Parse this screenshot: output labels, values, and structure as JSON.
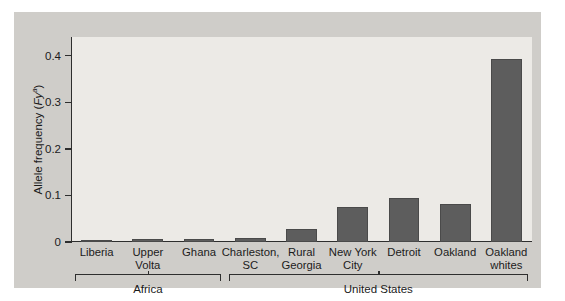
{
  "chart_data": {
    "type": "bar",
    "title": "",
    "xlabel": "",
    "ylabel": "Allele frequency (Fy^a)",
    "ylabel_parts": {
      "prefix": "Allele frequency (",
      "italic": "Fy",
      "sup": "a",
      "suffix": ")"
    },
    "categories": [
      "Liberia",
      "Upper Volta",
      "Ghana",
      "Charleston, SC",
      "Rural Georgia",
      "New York City",
      "Detroit",
      "Oakland",
      "Oakland whites"
    ],
    "category_label_lines": [
      [
        "Liberia"
      ],
      [
        "Upper",
        "Volta"
      ],
      [
        "Ghana"
      ],
      [
        "Charleston,",
        "SC"
      ],
      [
        "Rural",
        "Georgia"
      ],
      [
        "New York",
        "City"
      ],
      [
        "Detroit"
      ],
      [
        "Oakland"
      ],
      [
        "Oakland",
        "whites"
      ]
    ],
    "values": [
      0.004,
      0.006,
      0.007,
      0.008,
      0.029,
      0.075,
      0.094,
      0.081,
      0.392
    ],
    "ylim": [
      0,
      0.44
    ],
    "yticks": [
      0,
      0.1,
      0.2,
      0.3,
      0.4
    ],
    "ytick_labels": [
      "0",
      "0.1",
      "0.2",
      "0.3",
      "0.4"
    ],
    "grid": false,
    "legend": null,
    "bar_color": "#5d5d5d",
    "plot_background": "#eceae6",
    "figure_background": "#cfcdc9",
    "groups": [
      {
        "label": "Africa",
        "start_index": 0,
        "end_index": 2
      },
      {
        "label": "United States",
        "start_index": 3,
        "end_index": 8
      }
    ]
  }
}
